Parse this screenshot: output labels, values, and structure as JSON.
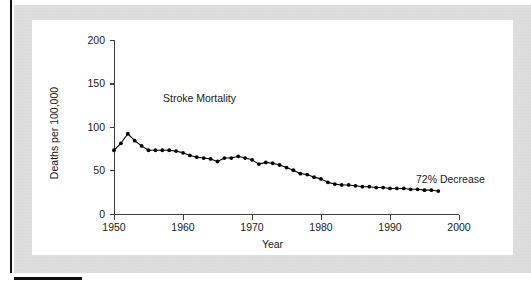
{
  "figure": {
    "panel_background": "#ffffff",
    "scan_margin_color": "#e2e2e2",
    "ink_color": "#111111"
  },
  "chart_data": {
    "type": "line",
    "title": "",
    "xlabel": "Year",
    "ylabel": "Deaths per 100,000",
    "xlim": [
      1950,
      2000
    ],
    "ylim": [
      0,
      200
    ],
    "xticks": [
      1950,
      1960,
      1970,
      1980,
      1990,
      2000
    ],
    "xtick_labels": [
      "1950",
      "1960",
      "1970",
      "1980",
      "1990",
      "2000"
    ],
    "yticks": [
      0,
      50,
      100,
      150,
      200
    ],
    "ytick_labels": [
      "0",
      "50",
      "100",
      "150",
      "200"
    ],
    "grid": false,
    "legend": "none",
    "marker": "filled-circle",
    "line_color": "#000000",
    "series": [
      {
        "name": "Stroke Mortality",
        "label_position": "inside-upper-left",
        "x": [
          1950,
          1951,
          1952,
          1953,
          1954,
          1955,
          1956,
          1957,
          1958,
          1959,
          1960,
          1961,
          1962,
          1963,
          1964,
          1965,
          1966,
          1967,
          1968,
          1969,
          1970,
          1971,
          1972,
          1973,
          1974,
          1975,
          1976,
          1977,
          1978,
          1979,
          1980,
          1981,
          1982,
          1983,
          1984,
          1985,
          1986,
          1987,
          1988,
          1989,
          1990,
          1991,
          1992,
          1993,
          1994,
          1995,
          1996,
          1997
        ],
        "values": [
          73,
          81,
          92,
          84,
          78,
          73,
          73,
          73,
          73,
          72,
          70,
          67,
          65,
          64,
          63,
          60,
          64,
          64,
          66,
          64,
          62,
          57,
          59,
          58,
          56,
          53,
          50,
          46,
          45,
          42,
          40,
          36,
          34,
          33,
          33,
          32,
          31,
          31,
          30,
          30,
          29,
          29,
          29,
          28,
          28,
          27,
          27,
          26
        ]
      }
    ],
    "annotations": [
      {
        "text": "72% Decrease",
        "attached_to_year": 1997,
        "position": "right-of-series-end"
      },
      {
        "text": "Stroke Mortality",
        "position": "inside-plot"
      }
    ]
  }
}
